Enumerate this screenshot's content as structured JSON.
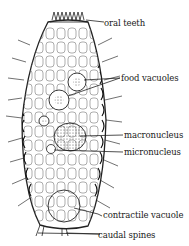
{
  "diagram": {
    "labels": [
      {
        "id": "oral-teeth",
        "text": "oral teeth"
      },
      {
        "id": "food-vacuoles",
        "text": "food vacuoles"
      },
      {
        "id": "macronucleus",
        "text": "macronucleus"
      },
      {
        "id": "micronucleus",
        "text": "micronucleus"
      },
      {
        "id": "contractile-vacuole",
        "text": "contractile vacuole"
      },
      {
        "id": "caudal-spines",
        "text": "caudal spines"
      }
    ],
    "colors": {
      "ink": "#1a1a1a",
      "background": "#ffffff"
    }
  }
}
